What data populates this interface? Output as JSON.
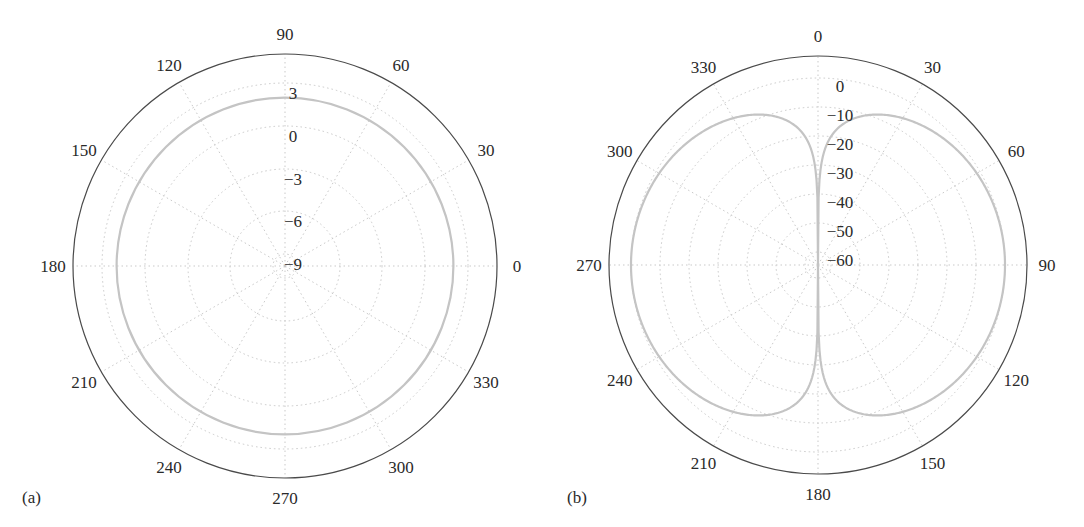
{
  "figure": {
    "panels": [
      {
        "id": "a",
        "label": "(a)"
      },
      {
        "id": "b",
        "label": "(b)"
      }
    ],
    "colors": {
      "outer_circle": "#4a4a4a",
      "grid": "#c9c9c9",
      "data_line": "#c4c4c4",
      "text": "#2a2a2a"
    }
  },
  "chart_data": [
    {
      "type": "polar-line",
      "panel_label": "(a)",
      "title": "",
      "angle_convention": "counterclockwise, 0 at right (east), degrees",
      "angle_ticks": [
        0,
        30,
        60,
        90,
        120,
        150,
        180,
        210,
        240,
        270,
        300,
        330
      ],
      "radial_unit": "dB",
      "radial_ticks": [
        3,
        0,
        -3,
        -6,
        -9
      ],
      "rlim": [
        -10,
        5
      ],
      "grid": true,
      "series": [
        {
          "name": "pattern",
          "description": "constant (isotropic/omnidirectional) gain",
          "theta_deg": [
            0,
            30,
            60,
            90,
            120,
            150,
            180,
            210,
            240,
            270,
            300,
            330,
            360
          ],
          "r_db": [
            2,
            2,
            2,
            2,
            2,
            2,
            2,
            2,
            2,
            2,
            2,
            2,
            2
          ]
        }
      ]
    },
    {
      "type": "polar-line",
      "panel_label": "(b)",
      "title": "",
      "angle_convention": "clockwise, 0 at top (north), degrees",
      "angle_ticks": [
        0,
        30,
        60,
        90,
        120,
        150,
        180,
        210,
        240,
        270,
        300,
        330
      ],
      "radial_unit": "dB",
      "radial_ticks": [
        0,
        -10,
        -20,
        -30,
        -40,
        -50,
        -60
      ],
      "rlim": [
        -70,
        7
      ],
      "grid": true,
      "series": [
        {
          "name": "pattern",
          "description": "20*log10|sin(theta)| (dipole pattern), nulls at 0 and 180",
          "theta_deg": [
            0,
            5,
            10,
            20,
            30,
            45,
            60,
            90,
            120,
            135,
            150,
            160,
            170,
            175,
            180,
            185,
            190,
            200,
            210,
            225,
            240,
            270,
            300,
            315,
            330,
            340,
            350,
            355,
            360
          ],
          "r_db": [
            -70,
            -21.2,
            -15.2,
            -9.3,
            -6.0,
            -3.0,
            -1.2,
            0,
            -1.2,
            -3.0,
            -6.0,
            -9.3,
            -15.2,
            -21.2,
            -70,
            -21.2,
            -15.2,
            -9.3,
            -6.0,
            -3.0,
            -1.2,
            0,
            -1.2,
            -3.0,
            -6.0,
            -9.3,
            -15.2,
            -21.2,
            -70
          ]
        }
      ]
    }
  ],
  "layout": {
    "a": {
      "cx": 285,
      "cy": 266,
      "outer_r": 212,
      "ring_r": {
        "3": 183,
        "0": 140,
        "-3": 97,
        "-6": 55,
        "-9": 12
      },
      "px_per_db": 14.2,
      "zero_r": 140
    },
    "b": {
      "cx": 818,
      "cy": 265,
      "outer_r": 209,
      "ring_r": {
        "0": 187,
        "-10": 158,
        "-20": 129,
        "-30": 100,
        "-40": 71,
        "-50": 42,
        "-60": 13
      },
      "px_per_db": 2.9,
      "zero_r": 187
    }
  }
}
